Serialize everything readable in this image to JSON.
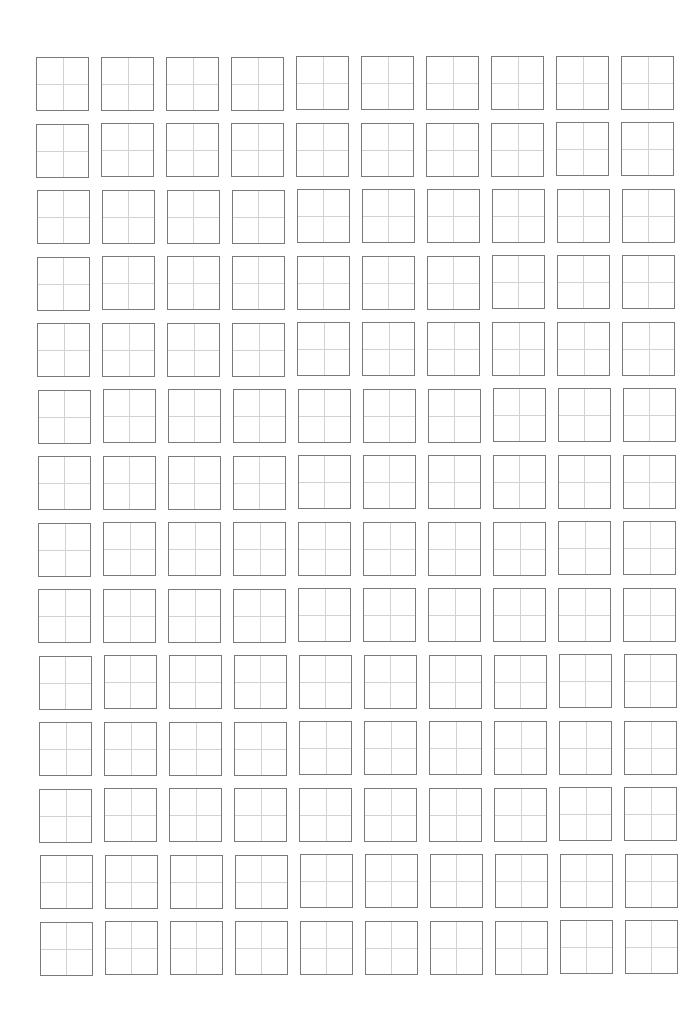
{
  "document": {
    "type": "chinese-character-practice-sheet",
    "grid_style": "tian-zi-ge",
    "rows": 14,
    "columns": 10,
    "cells_filled": 0
  },
  "layout": {
    "first_cell_left": 36,
    "first_cell_top": 57,
    "cell_width": 53,
    "cell_height": 54,
    "column_pitch": 65,
    "row_pitch": 66.5,
    "row_skew_x_per_row": 0.3
  },
  "colors": {
    "background": "#ffffff",
    "cell_border": "#7a7a7a",
    "guide_lines": "#d2d2d2"
  }
}
